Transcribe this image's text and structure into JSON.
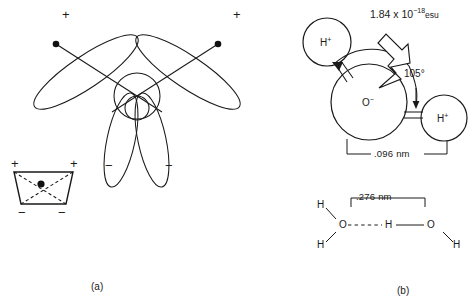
{
  "figure": {
    "title_caption_a": "(a)",
    "title_caption_b": "(b)"
  },
  "panel_a": {
    "name": "orbital-lobe-diagram",
    "charge_signs": {
      "top_left_plus": "+",
      "top_right_plus": "+",
      "bottom_left_minus": "−",
      "bottom_right_minus": "−"
    },
    "inset": {
      "name": "tetrahedron-inset",
      "plus_left": "+",
      "plus_right": "+",
      "minus_left": "−",
      "minus_right": "−"
    }
  },
  "panel_b": {
    "name": "water-molecule-diagram",
    "dipole_label": "1.84 x 10",
    "dipole_exponent": "−18",
    "dipole_units": "esu",
    "angle_label": "105°",
    "bond_length_label": ".096 nm",
    "oxygen_label": "O",
    "oxygen_charge": "−",
    "hydrogen_label": "H",
    "hydrogen_charge": "+",
    "hbond": {
      "name": "hydrogen-bond-diagram",
      "distance_label": ".276 nm",
      "atom_h": "H",
      "atom_o": "O"
    }
  },
  "colors": {
    "stroke": "#1a1a1a",
    "background": "#ffffff"
  }
}
